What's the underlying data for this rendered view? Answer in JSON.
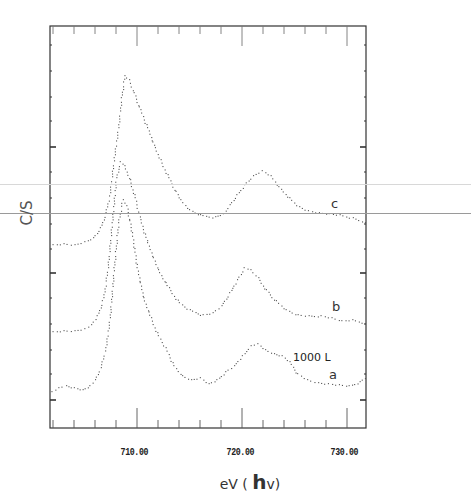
{
  "chart_data": {
    "type": "scatter",
    "title": "",
    "xlabel": "eV ( hv)",
    "ylabel": "C/S",
    "xlim": [
      701.7,
      731.8
    ],
    "x_ticks": [
      "710.00",
      "720.00",
      "730.00"
    ],
    "x_tick_values": [
      710,
      720,
      730
    ],
    "y_ticks_labeled": false,
    "grid": false,
    "legend": null,
    "annotations": [
      {
        "text": "c",
        "x": 728.5,
        "series": "c"
      },
      {
        "text": "b",
        "x": 728.5,
        "series": "b"
      },
      {
        "text": "a",
        "x": 728.5,
        "series": "a"
      },
      {
        "text": "1000 L",
        "x": 725.0,
        "series": "a"
      }
    ],
    "series": [
      {
        "name": "c",
        "x": [
          702.0,
          703.0,
          704.0,
          705.0,
          705.8,
          706.5,
          707.0,
          707.4,
          707.8,
          708.2,
          708.5,
          708.8,
          709.2,
          709.7,
          710.3,
          711.0,
          711.7,
          712.2,
          713.0,
          714.1,
          715.0,
          716.0,
          717.4,
          718.2,
          718.8,
          719.5,
          720.2,
          721.0,
          721.9,
          722.7,
          723.5,
          724.5,
          725.4,
          726.3,
          727.3,
          728.3,
          729.3,
          730.5,
          731.7
        ],
        "values": [
          183,
          184,
          183,
          186,
          190,
          200,
          215,
          235,
          270,
          300,
          330,
          352,
          348,
          335,
          318,
          300,
          280,
          268,
          250,
          228,
          218,
          213,
          211,
          214,
          223,
          233,
          243,
          252,
          257,
          252,
          241,
          230,
          221,
          217,
          215,
          214,
          213,
          210,
          206
        ]
      },
      {
        "name": "b",
        "x": [
          702.0,
          703.0,
          704.0,
          705.0,
          705.6,
          706.2,
          706.8,
          707.2,
          707.6,
          708.0,
          708.4,
          708.8,
          709.3,
          709.8,
          710.3,
          711.0,
          712.0,
          713.0,
          714.0,
          715.0,
          716.3,
          717.2,
          718.0,
          718.8,
          719.5,
          720.2,
          720.8,
          721.5,
          722.3,
          723.2,
          724.2,
          725.3,
          726.3,
          727.5,
          728.5,
          729.5,
          730.5,
          731.7
        ],
        "values": [
          96,
          97,
          97,
          99,
          103,
          112,
          130,
          160,
          205,
          250,
          266,
          262,
          248,
          230,
          208,
          185,
          158,
          140,
          125,
          118,
          113,
          115,
          122,
          135,
          148,
          160,
          158,
          150,
          138,
          127,
          118,
          113,
          112,
          112,
          110,
          107,
          108,
          105
        ]
      },
      {
        "name": "a",
        "x": [
          701.9,
          702.5,
          703.2,
          704.0,
          704.8,
          705.5,
          706.0,
          706.5,
          707.0,
          707.4,
          707.8,
          708.2,
          708.6,
          709.0,
          709.5,
          710.0,
          710.6,
          711.3,
          712.0,
          712.7,
          713.5,
          714.3,
          715.1,
          716.0,
          716.8,
          717.6,
          718.4,
          719.2,
          720.0,
          720.8,
          721.5,
          722.2,
          723.0,
          723.8,
          724.5,
          725.3,
          726.2,
          727.2,
          728.2,
          729.2,
          730.2,
          731.2,
          731.7
        ],
        "values": [
          36,
          40,
          42,
          40,
          38,
          42,
          48,
          60,
          80,
          110,
          160,
          205,
          228,
          222,
          195,
          160,
          130,
          110,
          92,
          80,
          62,
          52,
          48,
          50,
          44,
          48,
          56,
          62,
          72,
          82,
          84,
          78,
          74,
          72,
          66,
          54,
          48,
          45,
          44,
          43,
          42,
          46,
          50
        ]
      }
    ],
    "pixel_mapping": {
      "x_px_per_eV": 10.5,
      "x_px_at_710": 137,
      "y_zero_px": 428
    }
  },
  "ui": {
    "x_tick_labels": [
      "710.00",
      "720.00",
      "730.00"
    ],
    "xlabel_prefix": "eV ( ",
    "xlabel_h": "h",
    "xlabel_suffix": "v)",
    "ylabel": "C/S",
    "curve_labels": {
      "c": "c",
      "b": "b",
      "a": "a"
    },
    "annotation_dose": "1000 L"
  },
  "overlay_lines": [
    {
      "y": 184,
      "color": "#d8d8d8"
    },
    {
      "y": 213,
      "color": "#9a9a9a"
    }
  ]
}
